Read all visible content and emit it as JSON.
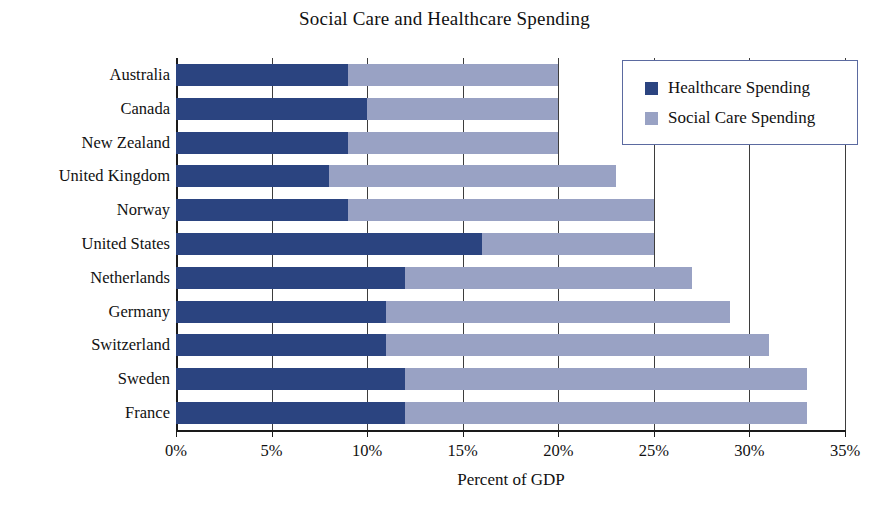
{
  "chart_data": {
    "type": "bar",
    "orientation": "horizontal",
    "stacked": true,
    "title": "Social Care and Healthcare Spending",
    "xlabel": "Percent of GDP",
    "ylabel": "",
    "xlim": [
      0,
      35
    ],
    "xticks": [
      0,
      5,
      10,
      15,
      20,
      25,
      30,
      35
    ],
    "xtick_labels": [
      "0%",
      "5%",
      "10%",
      "15%",
      "20%",
      "25%",
      "30%",
      "35%"
    ],
    "grid": true,
    "legend_position": "top-right",
    "categories": [
      "Australia",
      "Canada",
      "New Zealand",
      "United Kingdom",
      "Norway",
      "United States",
      "Netherlands",
      "Germany",
      "Switzerland",
      "Sweden",
      "France"
    ],
    "series": [
      {
        "name": "Healthcare Spending",
        "color": "#2b4480",
        "values": [
          9,
          10,
          9,
          8,
          9,
          16,
          12,
          11,
          11,
          12,
          12
        ]
      },
      {
        "name": "Social Care Spending",
        "color": "#99a2c4",
        "values": [
          11,
          10,
          11,
          15,
          16,
          9,
          15,
          18,
          20,
          21,
          21
        ]
      }
    ],
    "totals": [
      20,
      20,
      20,
      23,
      25,
      25,
      27,
      29,
      31,
      33,
      33
    ]
  },
  "legend": {
    "entries": [
      {
        "label": "Healthcare Spending",
        "color": "#2b4480"
      },
      {
        "label": "Social Care Spending",
        "color": "#99a2c4"
      }
    ]
  },
  "colors": {
    "healthcare": "#2b4480",
    "social_care": "#99a2c4",
    "axis": "#1a1a1a",
    "grid": "#3d3d3d",
    "legend_border": "#5b6aa0",
    "background": "#ffffff"
  }
}
